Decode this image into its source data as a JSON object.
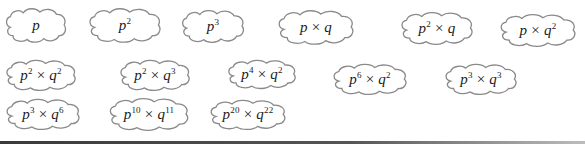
{
  "clouds": [
    {
      "id": "p",
      "base1": "p",
      "exp1": "",
      "base2": "",
      "exp2": "",
      "x": 4,
      "y": 6,
      "w": 64,
      "h": 38
    },
    {
      "id": "p2",
      "base1": "p",
      "exp1": "2",
      "base2": "",
      "exp2": "",
      "x": 87,
      "y": 6,
      "w": 76,
      "h": 38
    },
    {
      "id": "p3",
      "base1": "p",
      "exp1": "3",
      "base2": "",
      "exp2": "",
      "x": 180,
      "y": 8,
      "w": 66,
      "h": 36
    },
    {
      "id": "pxq",
      "base1": "p",
      "exp1": "",
      "base2": "q",
      "exp2": "",
      "x": 276,
      "y": 8,
      "w": 80,
      "h": 38
    },
    {
      "id": "p2xq",
      "base1": "p",
      "exp1": "2",
      "base2": "q",
      "exp2": "",
      "x": 399,
      "y": 10,
      "w": 76,
      "h": 36
    },
    {
      "id": "pxq2",
      "base1": "p",
      "exp1": "",
      "base2": "q",
      "exp2": "2",
      "x": 498,
      "y": 12,
      "w": 80,
      "h": 36
    },
    {
      "id": "p2xq2",
      "base1": "p",
      "exp1": "2",
      "base2": "q",
      "exp2": "2",
      "x": 4,
      "y": 58,
      "w": 74,
      "h": 34
    },
    {
      "id": "p2xq3",
      "base1": "p",
      "exp1": "2",
      "base2": "q",
      "exp2": "3",
      "x": 118,
      "y": 58,
      "w": 74,
      "h": 34
    },
    {
      "id": "p4xq2",
      "base1": "p",
      "exp1": "4",
      "base2": "q",
      "exp2": "2",
      "x": 226,
      "y": 58,
      "w": 72,
      "h": 32
    },
    {
      "id": "p6xq2",
      "base1": "p",
      "exp1": "6",
      "base2": "q",
      "exp2": "2",
      "x": 331,
      "y": 62,
      "w": 78,
      "h": 34
    },
    {
      "id": "p3xq3",
      "base1": "p",
      "exp1": "3",
      "base2": "q",
      "exp2": "3",
      "x": 443,
      "y": 62,
      "w": 76,
      "h": 34
    },
    {
      "id": "p3xq6",
      "base1": "p",
      "exp1": "3",
      "base2": "q",
      "exp2": "6",
      "x": 4,
      "y": 97,
      "w": 78,
      "h": 34
    },
    {
      "id": "p10xq11",
      "base1": "p",
      "exp1": "10",
      "base2": "q",
      "exp2": "11",
      "x": 107,
      "y": 96,
      "w": 84,
      "h": 36
    },
    {
      "id": "p20xq22",
      "base1": "p",
      "exp1": "20",
      "base2": "q",
      "exp2": "22",
      "x": 208,
      "y": 98,
      "w": 80,
      "h": 33
    }
  ],
  "times_symbol": "×",
  "colors": {
    "cloud_stroke": "#8a8a8a",
    "text": "#1a1a1a",
    "background": "#ffffff"
  }
}
